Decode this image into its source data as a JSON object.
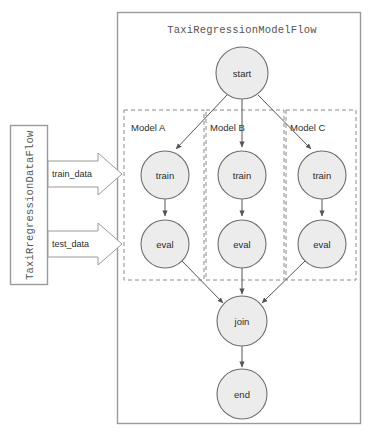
{
  "canvas": {
    "width": 370,
    "height": 434,
    "background": "#ffffff"
  },
  "colors": {
    "node_fill": "#ececec",
    "node_stroke": "#6e6e6e",
    "box_stroke": "#9a9a9a",
    "dashed_stroke": "#8a8a8a",
    "arrow_stroke": "#555555",
    "text": "#2d2d2d",
    "title_text": "#555555"
  },
  "model_flow": {
    "title": "TaxiRegressionModelFlow",
    "container_name": "model-flow-container"
  },
  "data_flow": {
    "title": "TaxiRregressionDataFlow",
    "container_name": "data-flow-container"
  },
  "data_arrows": [
    {
      "label": "train_data",
      "name": "train-data-arrow"
    },
    {
      "label": "test_data",
      "name": "test-data-arrow"
    }
  ],
  "groups": [
    {
      "label": "Model A",
      "name": "group-model-a"
    },
    {
      "label": "Model B",
      "name": "group-model-b"
    },
    {
      "label": "Model C",
      "name": "group-model-c"
    }
  ],
  "nodes": [
    {
      "id": "start",
      "label": "start",
      "cx": 242,
      "cy": 73,
      "r": 26
    },
    {
      "id": "train_a",
      "label": "train",
      "cx": 165,
      "cy": 175,
      "r": 24
    },
    {
      "id": "train_b",
      "label": "train",
      "cx": 242,
      "cy": 175,
      "r": 24
    },
    {
      "id": "train_c",
      "label": "train",
      "cx": 322,
      "cy": 175,
      "r": 24
    },
    {
      "id": "eval_a",
      "label": "eval",
      "cx": 165,
      "cy": 244,
      "r": 24
    },
    {
      "id": "eval_b",
      "label": "eval",
      "cx": 242,
      "cy": 244,
      "r": 24
    },
    {
      "id": "eval_c",
      "label": "eval",
      "cx": 322,
      "cy": 244,
      "r": 24
    },
    {
      "id": "join",
      "label": "join",
      "cx": 242,
      "cy": 321,
      "r": 25
    },
    {
      "id": "end",
      "label": "end",
      "cx": 242,
      "cy": 394,
      "r": 25
    }
  ],
  "edges": [
    {
      "from": "start",
      "to": "train_a"
    },
    {
      "from": "start",
      "to": "train_b"
    },
    {
      "from": "start",
      "to": "train_c"
    },
    {
      "from": "train_a",
      "to": "eval_a"
    },
    {
      "from": "train_b",
      "to": "eval_b"
    },
    {
      "from": "train_c",
      "to": "eval_c"
    },
    {
      "from": "eval_a",
      "to": "join"
    },
    {
      "from": "eval_b",
      "to": "join"
    },
    {
      "from": "eval_c",
      "to": "join"
    },
    {
      "from": "join",
      "to": "end"
    }
  ]
}
